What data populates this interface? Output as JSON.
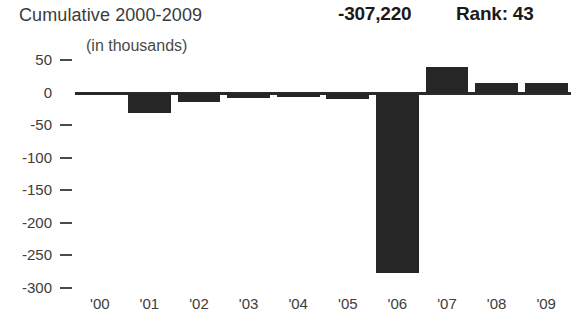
{
  "header": {
    "title": "Cumulative 2000-2009",
    "subtitle": "(in thousands)",
    "value": "-307,220",
    "rank": "Rank: 43"
  },
  "chart_data": {
    "type": "bar",
    "title": "Cumulative 2000-2009",
    "subtitle": "(in thousands)",
    "xlabel": "",
    "ylabel": "",
    "categories": [
      "'00",
      "'01",
      "'02",
      "'03",
      "'04",
      "'05",
      "'06",
      "'07",
      "'08",
      "'09"
    ],
    "values": [
      -3,
      -31,
      -15,
      -8,
      -7,
      -10,
      -277,
      39,
      14,
      14
    ],
    "ylim": [
      -300,
      50
    ],
    "yticks": [
      50,
      0,
      -50,
      -100,
      -150,
      -200,
      -250,
      -300
    ],
    "ytick_labels": [
      "50",
      "0",
      "-50",
      "-100",
      "-150",
      "-200",
      "-250",
      "-300"
    ],
    "grid": false,
    "legend": false,
    "bar_color": "#262626",
    "axis_color": "#2a2a2a",
    "zero_baseline": 0,
    "summary_total": "-307,220",
    "rank": "Rank: 43"
  }
}
